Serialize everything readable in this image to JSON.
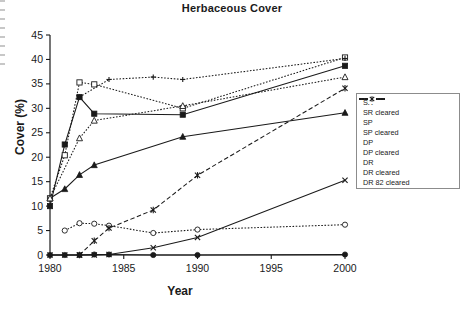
{
  "chart_data": {
    "type": "line",
    "title": "Herbaceous Cover",
    "xlabel": "Year",
    "ylabel": "Cover (%)",
    "xlim": [
      1980,
      2000
    ],
    "ylim": [
      0,
      45
    ],
    "xticks": [
      1980,
      1985,
      1990,
      1995,
      2000
    ],
    "yticks": [
      0,
      5,
      10,
      15,
      20,
      25,
      30,
      35,
      40,
      45
    ],
    "grid": false,
    "legend_position": "right",
    "series": [
      {
        "name": "SR",
        "marker": "filled-square",
        "line": "solid",
        "x": [
          1980,
          1981,
          1982,
          1983,
          1989,
          2000
        ],
        "values": [
          10.0,
          22.6,
          32.3,
          28.9,
          28.7,
          38.7
        ]
      },
      {
        "name": "SR cleared",
        "marker": "open-square",
        "line": "dotted",
        "x": [
          1980,
          1981,
          1982,
          1983,
          1989,
          2000
        ],
        "values": [
          11.6,
          20.4,
          35.3,
          34.9,
          30.0,
          40.4
        ]
      },
      {
        "name": "SP",
        "marker": "filled-triangle",
        "line": "solid",
        "x": [
          1980,
          1981,
          1982,
          1983,
          1989,
          2000
        ],
        "values": [
          11.6,
          13.5,
          16.4,
          18.4,
          24.2,
          29.1
        ]
      },
      {
        "name": "SP cleared",
        "marker": "open-triangle",
        "line": "dotted",
        "x": [
          1980,
          1982,
          1983,
          1989,
          2000
        ],
        "values": [
          11.6,
          23.9,
          27.5,
          30.5,
          36.4
        ]
      },
      {
        "name": "DP",
        "marker": "filled-circle",
        "line": "solid",
        "x": [
          1980,
          1981,
          1982,
          1983,
          1984,
          1987,
          1990,
          2000
        ],
        "values": [
          0.0,
          0.0,
          0.0,
          0.1,
          0.1,
          0.0,
          0.0,
          0.1
        ]
      },
      {
        "name": "DP cleared",
        "marker": "open-circle",
        "line": "dotted",
        "x": [
          1981,
          1982,
          1983,
          1984,
          1987,
          1990,
          2000
        ],
        "values": [
          5.0,
          6.5,
          6.4,
          6.0,
          4.5,
          5.2,
          6.2
        ]
      },
      {
        "name": "DR",
        "marker": "x-cross",
        "line": "solid",
        "x": [
          1980,
          1981,
          1982,
          1983,
          1984,
          1987,
          1990,
          2000
        ],
        "values": [
          0.0,
          0.0,
          0.0,
          0.0,
          0.1,
          1.5,
          3.6,
          15.3
        ]
      },
      {
        "name": "DR cleared",
        "marker": "plus",
        "line": "dotted",
        "x": [
          1982,
          1984,
          1987,
          1989,
          2000
        ],
        "values": [
          32.3,
          35.9,
          36.4,
          35.9,
          40.2
        ]
      },
      {
        "name": "DR 82 cleared",
        "marker": "star-x",
        "line": "dashed",
        "x": [
          1982,
          1983,
          1984,
          1987,
          1990,
          2000
        ],
        "values": [
          0.0,
          2.9,
          5.5,
          9.2,
          16.3,
          34.1
        ]
      }
    ]
  },
  "legend": {
    "items": [
      {
        "label": "SR"
      },
      {
        "label": "SR cleared"
      },
      {
        "label": "SP"
      },
      {
        "label": "SP cleared"
      },
      {
        "label": "DP"
      },
      {
        "label": "DP cleared"
      },
      {
        "label": "DR"
      },
      {
        "label": "DR cleared"
      },
      {
        "label": "DR 82 cleared"
      }
    ]
  }
}
